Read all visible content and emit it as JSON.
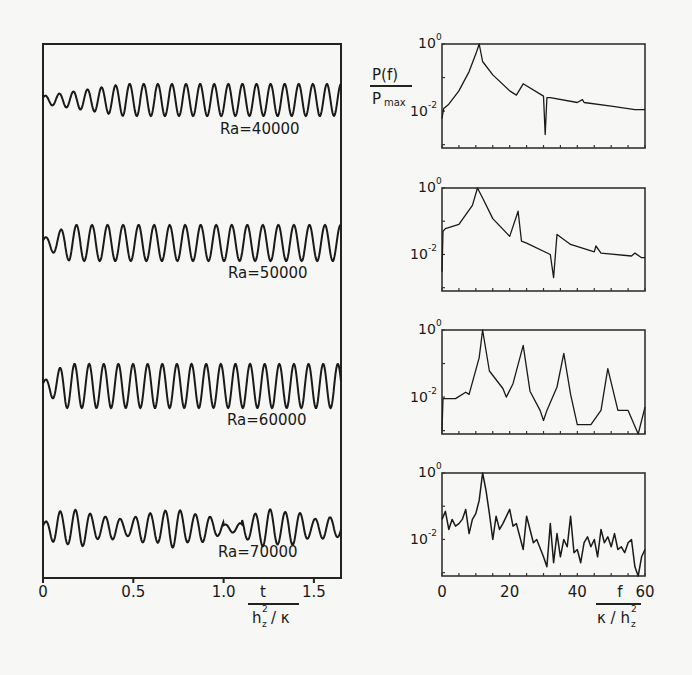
{
  "chart_data": [
    {
      "type": "line",
      "title": "",
      "panel": "time-series",
      "xlabel_num": "t",
      "xlabel_den": "h_z^2 / κ",
      "ylabel": "",
      "xlim": [
        0,
        1.65
      ],
      "x_ticks": [
        0,
        0.5,
        1.0,
        1.5
      ],
      "x_tick_labels": [
        "0",
        "0.5",
        "1.0",
        "1.5"
      ],
      "grid": false,
      "series": [
        {
          "name": "Ra = 40000",
          "label": "Ra=40000",
          "description": "oscillation growing in amplitude, ~21 cycles, saturating after t≈0.5"
        },
        {
          "name": "Ra = 50000",
          "label": "Ra=50000",
          "description": "fast growth to saturated periodic oscillation, ~19 cycles"
        },
        {
          "name": "Ra = 60000",
          "label": "Ra=60000",
          "description": "saturated periodic oscillation, ~20 cycles, higher amplitude"
        },
        {
          "name": "Ra = 70000",
          "label": "Ra=70000",
          "description": "irregular, amplitude-modulated oscillation"
        }
      ]
    },
    {
      "type": "line",
      "panel": "power-spectra",
      "ylabel_num": "P(f)",
      "ylabel_den": "P_max",
      "xlabel_num": "f",
      "xlabel_den": "κ / h_z^2",
      "xlim": [
        0,
        60
      ],
      "x_ticks": [
        0,
        20,
        40,
        60
      ],
      "x_tick_labels": [
        "0",
        "20",
        "40",
        "60"
      ],
      "yscale": "log",
      "y_tick_labels": [
        "10^0",
        "10^-2"
      ],
      "ylim": [
        0.0008,
        1
      ],
      "grid": false,
      "series": [
        {
          "name": "Ra = 40000",
          "x": [
            0,
            0.5,
            2,
            5,
            8,
            10,
            11,
            12,
            15,
            20,
            22,
            24,
            30,
            30.5,
            31,
            32,
            40,
            41.5,
            42,
            50,
            57,
            60
          ],
          "y": [
            0.006,
            0.012,
            0.016,
            0.04,
            0.15,
            0.5,
            1.0,
            0.3,
            0.12,
            0.04,
            0.03,
            0.065,
            0.028,
            0.002,
            0.025,
            0.025,
            0.018,
            0.022,
            0.018,
            0.014,
            0.011,
            0.011
          ]
        },
        {
          "name": "Ra = 50000",
          "x": [
            0,
            0.3,
            1,
            5,
            9,
            10.5,
            12,
            15,
            20,
            22.5,
            23.5,
            25,
            32,
            33,
            34,
            38,
            45,
            45.5,
            47,
            56,
            57,
            59,
            60
          ],
          "y": [
            0.003,
            0.05,
            0.06,
            0.08,
            0.3,
            1.0,
            0.5,
            0.12,
            0.035,
            0.2,
            0.025,
            0.022,
            0.01,
            0.002,
            0.04,
            0.02,
            0.012,
            0.018,
            0.011,
            0.009,
            0.011,
            0.008,
            0.008
          ]
        },
        {
          "name": "Ra = 60000",
          "x": [
            0,
            0.3,
            4,
            7,
            8,
            11,
            12,
            14,
            18,
            19,
            21,
            24,
            26,
            29,
            30,
            31,
            34,
            36,
            38,
            40,
            44,
            47,
            49,
            52,
            55,
            58,
            60
          ],
          "y": [
            0.001,
            0.009,
            0.009,
            0.014,
            0.012,
            0.15,
            1.0,
            0.06,
            0.018,
            0.01,
            0.025,
            0.35,
            0.015,
            0.004,
            0.002,
            0.004,
            0.02,
            0.2,
            0.012,
            0.0015,
            0.0015,
            0.004,
            0.07,
            0.004,
            0.004,
            0.0006,
            0.005
          ]
        },
        {
          "name": "Ra = 70000",
          "description": "noisy broadband spectrum; peak near f≈12, general decay to ~10^-2.5 by f≈60",
          "x": [
            0,
            1,
            2,
            3,
            4,
            5,
            6,
            7,
            8,
            9,
            10,
            11,
            12,
            13,
            14,
            15,
            16,
            17,
            18,
            20,
            21,
            22,
            24,
            25,
            27,
            28,
            30,
            31,
            32,
            33,
            34,
            35,
            36,
            37,
            38,
            39,
            40,
            41,
            42,
            43,
            44,
            45,
            46,
            47,
            48,
            49,
            50,
            51,
            52,
            53,
            54,
            55,
            56,
            57,
            58,
            59,
            60
          ],
          "y": [
            0.04,
            0.07,
            0.02,
            0.04,
            0.025,
            0.03,
            0.04,
            0.08,
            0.015,
            0.04,
            0.06,
            0.15,
            1.0,
            0.3,
            0.06,
            0.01,
            0.05,
            0.02,
            0.03,
            0.08,
            0.025,
            0.03,
            0.005,
            0.05,
            0.008,
            0.01,
            0.003,
            0.0015,
            0.03,
            0.002,
            0.015,
            0.003,
            0.01,
            0.006,
            0.05,
            0.004,
            0.005,
            0.002,
            0.008,
            0.012,
            0.006,
            0.01,
            0.003,
            0.02,
            0.008,
            0.012,
            0.006,
            0.015,
            0.005,
            0.006,
            0.004,
            0.008,
            0.01,
            0.0015,
            0.0004,
            0.003,
            0.005
          ]
        }
      ]
    }
  ],
  "left": {
    "labels": [
      "Ra = 40000",
      "Ra = 50000",
      "Ra = 60000",
      "Ra = 70000"
    ],
    "x_tick_labels": [
      "0",
      "0.5",
      "1.0",
      "1.5"
    ],
    "xlabel_num": "t",
    "xlabel_den_h": "h",
    "xlabel_den_rest": "/ κ"
  },
  "right": {
    "ylabel_num": "P(f)",
    "ylabel_den": "P",
    "ylabel_den_sub": "max",
    "ytick_top": "10",
    "ytick_top_exp": "0",
    "ytick_mid": "10",
    "ytick_mid_exp": "-2",
    "x_tick_labels": [
      "0",
      "20",
      "40",
      "60"
    ],
    "xlabel_num": "f",
    "xlabel_den_k": "κ / h"
  }
}
